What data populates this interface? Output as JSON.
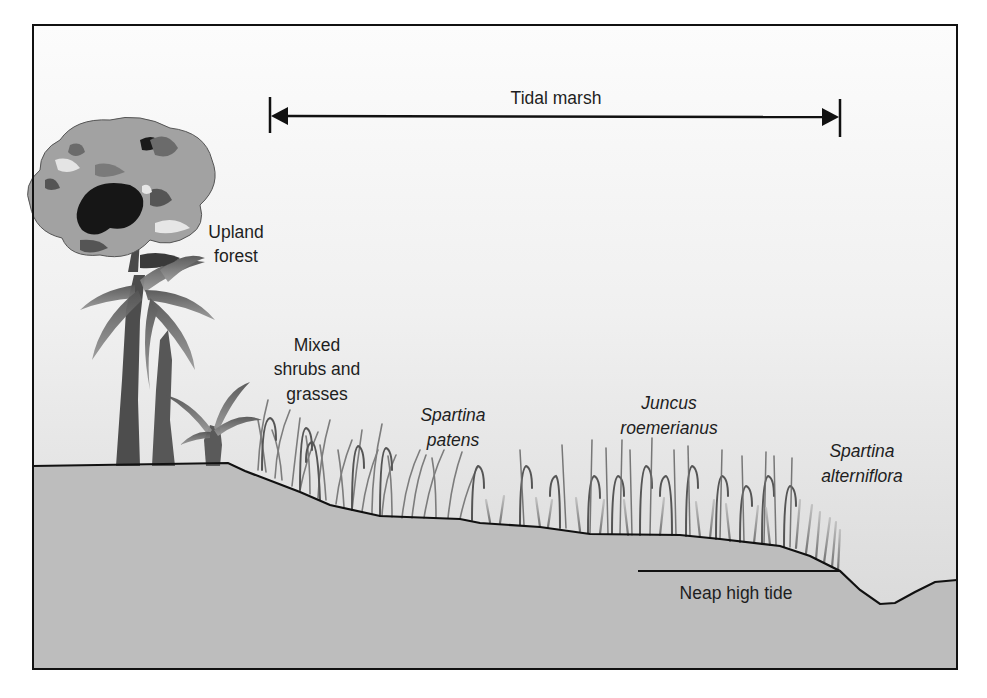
{
  "diagram": {
    "span_label": "Tidal marsh",
    "zones": [
      {
        "id": "upland-forest",
        "lines": [
          "Upland",
          "forest"
        ],
        "italic": false
      },
      {
        "id": "mixed-shrubs",
        "lines": [
          "Mixed",
          "shrubs and",
          "grasses"
        ],
        "italic": false
      },
      {
        "id": "spartina-patens",
        "lines": [
          "Spartina",
          "patens"
        ],
        "italic": true
      },
      {
        "id": "juncus-roemerianus",
        "lines": [
          "Juncus",
          "roemerianus"
        ],
        "italic": true
      },
      {
        "id": "spartina-alterniflora",
        "lines": [
          "Spartina",
          "alterniflora"
        ],
        "italic": true
      }
    ],
    "tide_label": "Neap high tide",
    "colors": {
      "sky_top": "#fbfbfb",
      "sky_bottom": "#d9d9d9",
      "ground": "#bdbdbd",
      "outline": "#111111",
      "grass": "#6a6a6a",
      "foliage_light": "#9e9e9e",
      "foliage_dark": "#1a1a1a",
      "trunk": "#4a4a4a"
    }
  }
}
